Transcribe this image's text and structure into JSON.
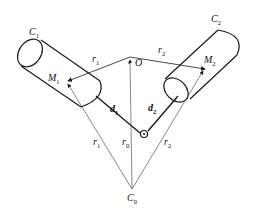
{
  "diagram": {
    "labels": {
      "C1": {
        "base": "C",
        "sub": "1"
      },
      "C2": {
        "base": "C",
        "sub": "2"
      },
      "M1": {
        "base": "M",
        "sub": "1"
      },
      "M2": {
        "base": "M",
        "sub": "2"
      },
      "O": {
        "base": "O"
      },
      "r1_0": {
        "base": "r",
        "sub": "1",
        "sup": "0"
      },
      "r2_0": {
        "base": "r",
        "sub": "2",
        "sup": "0"
      },
      "d1": {
        "base": "d",
        "sub": "1"
      },
      "d2": {
        "base": "d",
        "sub": "2"
      },
      "r1": {
        "base": "r",
        "sub": "1"
      },
      "r0": {
        "base": "r",
        "sub": "0"
      },
      "r2": {
        "base": "r",
        "sub": "2"
      },
      "C0": {
        "base": "C",
        "sub": "0"
      }
    },
    "colors": {
      "stroke": "#1a1a1a",
      "thin": "#555555"
    }
  }
}
